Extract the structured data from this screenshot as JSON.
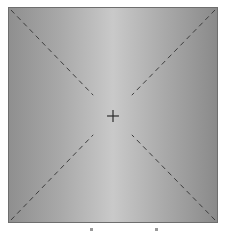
{
  "canvas": {
    "description": "Gradient square with dashed diagonals and center crosshair",
    "colors": {
      "edge": "#8f8f8f",
      "center": "#c9c9c9",
      "border": "#6e6e6e",
      "lines": "#3c3c3c"
    },
    "crosshair": {
      "x": 105,
      "y": 109
    }
  }
}
